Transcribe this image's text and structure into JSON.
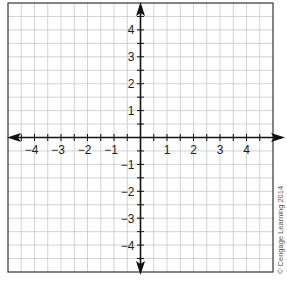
{
  "diagram": {
    "type": "coordinate-plane",
    "grid": {
      "cells_per_side": 20,
      "cells_per_unit": 2,
      "line_color": "#c8c8c8",
      "border_color": "#333333"
    },
    "axes": {
      "color": "#111111",
      "x_range": [
        -5,
        5
      ],
      "y_range": [
        -5,
        5
      ]
    },
    "x_tick_labels": [
      "−4",
      "−3",
      "−2",
      "−1",
      "1",
      "2",
      "3",
      "4"
    ],
    "x_tick_values": [
      -4,
      -3,
      -2,
      -1,
      1,
      2,
      3,
      4
    ],
    "y_tick_labels": [
      "4",
      "3",
      "2",
      "1",
      "−1",
      "−2",
      "−3",
      "−4"
    ],
    "y_tick_values": [
      4,
      3,
      2,
      1,
      -1,
      -2,
      -3,
      -4
    ]
  },
  "credit": "© Cengage Learning 2014"
}
